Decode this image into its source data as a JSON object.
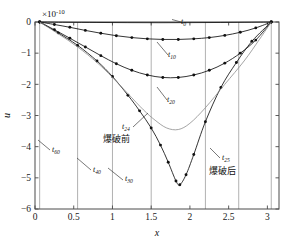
{
  "chart_data": {
    "type": "line",
    "title": "",
    "xlabel": "x",
    "ylabel": "u",
    "y_exponent_label": "×10",
    "y_exponent_value": "-10",
    "xlim": [
      0,
      3.15
    ],
    "ylim": [
      -6,
      0
    ],
    "xticks": [
      0,
      0.5,
      1,
      1.5,
      2,
      2.5,
      3
    ],
    "xticklabels": [
      "0",
      "0.5",
      "1",
      "1.5",
      "2",
      "2.5",
      "3"
    ],
    "yticks": [
      0,
      -1,
      -2,
      -3,
      -4,
      -5,
      -6
    ],
    "yticklabels": [
      "0",
      "−1",
      "−2",
      "−3",
      "−4",
      "−5",
      "−6"
    ],
    "grid": "vertical-only",
    "legend": "none",
    "vertical_gridlines_x": [
      0.06,
      0.55,
      1.0,
      1.5,
      2.2,
      2.63,
      3.05
    ],
    "series": [
      {
        "name": "t0",
        "label": "t",
        "label_sub": "0",
        "markers": false,
        "x": [
          0.06,
          0.4,
          0.8,
          1.2,
          1.6,
          2.0,
          2.4,
          2.8,
          3.05
        ],
        "values": [
          0.0,
          -0.01,
          -0.015,
          -0.02,
          -0.022,
          -0.02,
          -0.015,
          -0.008,
          0.0
        ]
      },
      {
        "name": "t10",
        "label": "t",
        "label_sub": "10",
        "markers": true,
        "x": [
          0.06,
          0.25,
          0.45,
          0.65,
          0.85,
          1.05,
          1.25,
          1.45,
          1.65,
          1.85,
          2.05,
          2.25,
          2.45,
          2.65,
          2.85,
          3.05
        ],
        "values": [
          0.0,
          -0.08,
          -0.17,
          -0.27,
          -0.36,
          -0.44,
          -0.5,
          -0.54,
          -0.56,
          -0.56,
          -0.54,
          -0.5,
          -0.43,
          -0.33,
          -0.19,
          0.0
        ]
      },
      {
        "name": "t20",
        "label": "t",
        "label_sub": "20",
        "markers": true,
        "x": [
          0.06,
          0.25,
          0.45,
          0.65,
          0.85,
          1.05,
          1.25,
          1.45,
          1.65,
          1.85,
          2.05,
          2.25,
          2.45,
          2.65,
          2.85,
          3.05
        ],
        "values": [
          0.0,
          -0.25,
          -0.52,
          -0.8,
          -1.08,
          -1.34,
          -1.55,
          -1.7,
          -1.78,
          -1.78,
          -1.7,
          -1.55,
          -1.32,
          -1.0,
          -0.58,
          0.0
        ]
      },
      {
        "name": "t24",
        "label": "t",
        "label_sub": "24",
        "caption": "爆破前",
        "markers": true,
        "x": [
          0.06,
          0.3,
          0.55,
          0.8,
          1.0,
          1.2,
          1.35,
          1.5,
          1.62,
          1.72,
          1.82,
          1.87,
          1.95,
          2.05,
          2.2,
          2.4,
          2.6,
          2.8,
          3.05
        ],
        "values": [
          0.0,
          -0.35,
          -0.75,
          -1.25,
          -1.75,
          -2.35,
          -2.85,
          -3.4,
          -3.95,
          -4.5,
          -5.1,
          -5.22,
          -4.9,
          -4.25,
          -3.2,
          -2.1,
          -1.3,
          -0.62,
          0.0
        ]
      },
      {
        "name": "t25",
        "label": "t",
        "label_sub": "25",
        "caption": "爆破后",
        "markers": false,
        "x": [
          0.06,
          0.3,
          0.55,
          0.8,
          1.0,
          1.2,
          1.4,
          1.55,
          1.7,
          1.85,
          2.0,
          2.2,
          2.45,
          2.7,
          2.9,
          3.05
        ],
        "values": [
          0.0,
          -0.38,
          -0.8,
          -1.3,
          -1.78,
          -2.3,
          -2.82,
          -3.15,
          -3.4,
          -3.45,
          -3.25,
          -2.75,
          -2.0,
          -1.25,
          -0.55,
          0.0
        ]
      },
      {
        "name": "t30",
        "label": "t",
        "label_sub": "30",
        "markers": false,
        "x": [
          1.5
        ],
        "values": [
          0
        ]
      },
      {
        "name": "t40",
        "label": "t",
        "label_sub": "40",
        "markers": false,
        "x": [
          1.0
        ],
        "values": [
          0
        ]
      },
      {
        "name": "t60",
        "label": "t",
        "label_sub": "60",
        "markers": false,
        "x": [
          0.55
        ],
        "values": [
          0
        ]
      }
    ],
    "annotations": [
      {
        "name": "t0",
        "label": "t",
        "sub": "0",
        "x_px": 181,
        "y_px": 24
      },
      {
        "name": "t10",
        "label": "t",
        "sub": "10",
        "x_px": 168,
        "y_px": 57
      },
      {
        "name": "t20",
        "label": "t",
        "sub": "20",
        "x_px": 167,
        "y_px": 102
      },
      {
        "name": "t24",
        "label": "t",
        "sub": "24",
        "x_px": 122,
        "y_px": 129,
        "caption": "爆破前",
        "cap_x_px": 103,
        "cap_y_px": 142
      },
      {
        "name": "t25",
        "label": "t",
        "sub": "25",
        "x_px": 222,
        "y_px": 160,
        "caption": "爆破后",
        "cap_x_px": 209,
        "cap_y_px": 174
      },
      {
        "name": "t30",
        "label": "t",
        "sub": "30",
        "x_px": 125,
        "y_px": 181
      },
      {
        "name": "t40",
        "label": "t",
        "sub": "40",
        "x_px": 93,
        "y_px": 172
      },
      {
        "name": "t60",
        "label": "t",
        "sub": "60",
        "x_px": 52,
        "y_px": 152
      }
    ]
  },
  "colors": {
    "curve": "#111111",
    "gridline": "#a8a8a8",
    "axis": "#4a4a4a",
    "background": "#ffffff"
  }
}
